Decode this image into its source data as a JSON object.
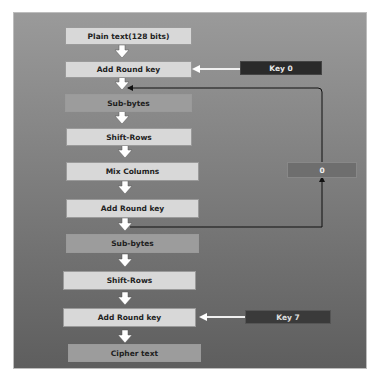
{
  "diagram": {
    "steps": [
      {
        "label": "Plain text(128 bits)"
      },
      {
        "label": "Add Round key"
      },
      {
        "label": "Sub-bytes"
      },
      {
        "label": "Shift-Rows"
      },
      {
        "label": "Mix Columns"
      },
      {
        "label": "Add Round key"
      },
      {
        "label": "Sub-bytes"
      },
      {
        "label": "Shift-Rows"
      },
      {
        "label": "Add Round key"
      },
      {
        "label": "Cipher text"
      }
    ],
    "keys": [
      {
        "label": "Key 0",
        "target_step": 1
      },
      {
        "label": "Key 7",
        "target_step": 8
      }
    ],
    "loop_counter": {
      "label": "0"
    },
    "colors": {
      "panel_top": "#9a9a9a",
      "panel_bottom": "#5e5e5e",
      "box_light": "#d8d8d8",
      "box_mid": "#9c9c9c",
      "key_box": "#2a2a2a",
      "arrow": "#ffffff"
    }
  }
}
